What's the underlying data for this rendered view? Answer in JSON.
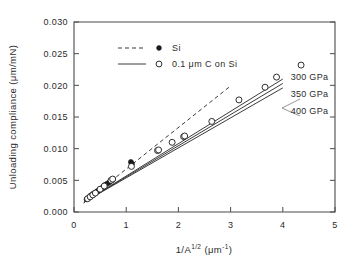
{
  "chart_data": {
    "type": "scatter",
    "title": "",
    "subtitle": "",
    "xlabel": "1/A^1/2 (μm^-1)",
    "xlabel_parts": {
      "base": "1/A",
      "exponent": "1/2",
      "units_open": " (",
      "units_base": "μm",
      "units_exp": "-1",
      "units_close": ")"
    },
    "ylabel": "Unloading compliance (μm/mN)",
    "xlim": [
      0,
      5
    ],
    "ylim": [
      0,
      0.03
    ],
    "xticks": [
      0,
      1,
      2,
      3,
      4,
      5
    ],
    "xticklabels": [
      "0",
      "1",
      "2",
      "3",
      "4",
      "5"
    ],
    "yticks": [
      0.0,
      0.005,
      0.01,
      0.015,
      0.02,
      0.025,
      0.03
    ],
    "yticklabels": [
      "0.000",
      "0.005",
      "0.010",
      "0.015",
      "0.020",
      "0.025",
      "0.030"
    ],
    "grid": false,
    "legend_position": "upper-left-inside",
    "legend": [
      {
        "label": "Si",
        "marker": "filled-circle",
        "line": "dashed"
      },
      {
        "label": "0.1 μm C on Si",
        "marker": "open-circle",
        "line": "solid"
      }
    ],
    "annotations": [
      {
        "text": "300 GPa",
        "x": 4.15,
        "y": 0.0213
      },
      {
        "text": "350 GPa",
        "x": 4.15,
        "y": 0.0186
      },
      {
        "text": "400 GPa",
        "x": 4.15,
        "y": 0.016
      }
    ],
    "series": [
      {
        "name": "Si",
        "marker": "filled-circle",
        "line": "dashed",
        "points": [
          [
            0.24,
            0.002
          ],
          [
            0.27,
            0.0022
          ],
          [
            0.3,
            0.0024
          ],
          [
            0.32,
            0.0026
          ],
          [
            0.35,
            0.0027
          ],
          [
            0.37,
            0.0029
          ],
          [
            0.4,
            0.003
          ],
          [
            0.42,
            0.0031
          ],
          [
            0.45,
            0.0033
          ],
          [
            0.48,
            0.0034
          ],
          [
            0.52,
            0.0037
          ],
          [
            0.56,
            0.004
          ],
          [
            0.6,
            0.0043
          ],
          [
            0.64,
            0.0045
          ],
          [
            0.68,
            0.0047
          ],
          [
            0.72,
            0.005
          ],
          [
            0.75,
            0.0052
          ],
          [
            1.09,
            0.0079
          ],
          [
            1.11,
            0.0076
          ]
        ],
        "fit_line": {
          "x0": 0.18,
          "y0": 0.0014,
          "x1": 3.0,
          "y1": 0.0199
        }
      },
      {
        "name": "0.1 μm C on Si",
        "marker": "open-circle",
        "line": "solid",
        "points": [
          [
            0.26,
            0.0021
          ],
          [
            0.31,
            0.0024
          ],
          [
            0.36,
            0.0027
          ],
          [
            0.41,
            0.003
          ],
          [
            0.5,
            0.0036
          ],
          [
            0.58,
            0.0041
          ],
          [
            0.71,
            0.005
          ],
          [
            0.74,
            0.0052
          ],
          [
            1.1,
            0.0072
          ],
          [
            1.6,
            0.0097
          ],
          [
            1.62,
            0.0098
          ],
          [
            1.88,
            0.011
          ],
          [
            2.1,
            0.0119
          ],
          [
            2.12,
            0.012
          ],
          [
            2.64,
            0.0143
          ],
          [
            3.16,
            0.0177
          ],
          [
            3.66,
            0.0197
          ],
          [
            3.88,
            0.0213
          ],
          [
            4.35,
            0.0232
          ]
        ]
      }
    ],
    "model_lines": [
      {
        "name": "300 GPa",
        "x0": 0.2,
        "y0": 0.0016,
        "x1": 4.0,
        "y1": 0.021
      },
      {
        "name": "350 GPa",
        "x0": 0.2,
        "y0": 0.0016,
        "x1": 4.0,
        "y1": 0.0203
      },
      {
        "name": "400 GPa",
        "x0": 0.2,
        "y0": 0.0016,
        "x1": 4.0,
        "y1": 0.0196
      }
    ]
  }
}
